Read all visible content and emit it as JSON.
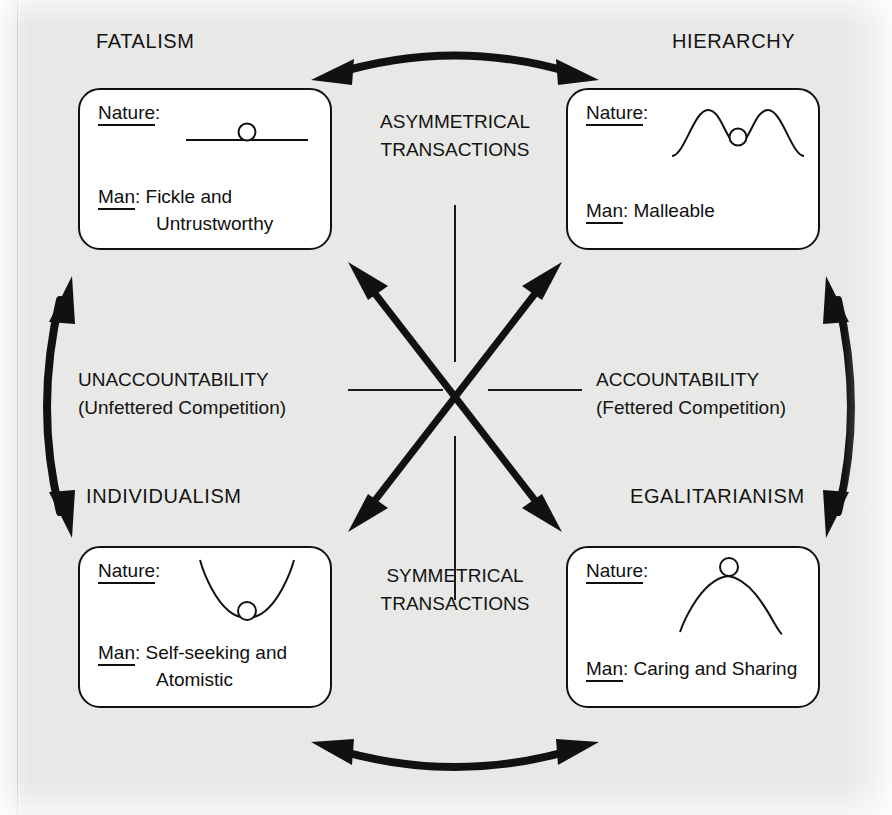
{
  "diagram": {
    "type": "cultural-theory-grid-group-quadrant",
    "background_color": "#e8e8e6",
    "ink_color": "#111111",
    "card_fill": "#ffffff"
  },
  "axes": {
    "vertical_top_label": {
      "line1": "ASYMMETRICAL",
      "line2": "TRANSACTIONS"
    },
    "vertical_bottom_label": {
      "line1": "SYMMETRICAL",
      "line2": "TRANSACTIONS"
    },
    "horizontal_left_label": {
      "line1": "UNACCOUNTABILITY",
      "line2": "(Unfettered Competition)"
    },
    "horizontal_right_label": {
      "line1": "ACCOUNTABILITY",
      "line2": "(Fettered Competition)"
    }
  },
  "quadrants": [
    {
      "id": "fatalism",
      "title": "FATALISM",
      "nature_label": "Nature:",
      "nature_underlined": "Nature",
      "nature_icon": "flat-line-with-ball",
      "nature_description": "ball resting on a flat horizontal line (capricious nature)",
      "man_label": "Man",
      "man_separator": ": ",
      "man_value_line1": "Fickle and",
      "man_value_line2": "Untrustworthy"
    },
    {
      "id": "hierarchy",
      "title": "HIERARCHY",
      "nature_label": "Nature:",
      "nature_underlined": "Nature",
      "nature_icon": "two-peaks-ball-in-valley",
      "nature_description": "ball in a shallow valley between two peaks (perverse/tolerant nature)",
      "man_label": "Man",
      "man_separator": ":  ",
      "man_value_line1": "Malleable",
      "man_value_line2": ""
    },
    {
      "id": "individualism",
      "title": "INDIVIDUALISM",
      "nature_label": "Nature:",
      "nature_underlined": "Nature",
      "nature_icon": "basin-ball-at-bottom",
      "nature_description": "ball at the bottom of a basin (benign nature)",
      "man_label": "Man",
      "man_separator": ": ",
      "man_value_line1": "Self-seeking and",
      "man_value_line2": "Atomistic"
    },
    {
      "id": "egalitarianism",
      "title": "EGALITARIANISM",
      "nature_label": "Nature:",
      "nature_underlined": "Nature",
      "nature_icon": "peak-ball-on-top",
      "nature_description": "ball balanced on top of a peak (ephemeral nature)",
      "man_label": "Man",
      "man_separator": ": ",
      "man_value_line1": "Caring and Sharing",
      "man_value_line2": ""
    }
  ],
  "connectors": [
    {
      "id": "top",
      "shape": "curved-double-arrow",
      "from": "fatalism",
      "to": "hierarchy"
    },
    {
      "id": "bottom",
      "shape": "curved-double-arrow",
      "from": "individualism",
      "to": "egalitarianism"
    },
    {
      "id": "left",
      "shape": "curved-double-arrow",
      "from": "fatalism",
      "to": "individualism"
    },
    {
      "id": "right",
      "shape": "curved-double-arrow",
      "from": "hierarchy",
      "to": "egalitarianism"
    },
    {
      "id": "diagonal-nw-se",
      "shape": "straight-double-arrow",
      "from": "fatalism",
      "to": "egalitarianism"
    },
    {
      "id": "diagonal-ne-sw",
      "shape": "straight-double-arrow",
      "from": "hierarchy",
      "to": "individualism"
    }
  ]
}
